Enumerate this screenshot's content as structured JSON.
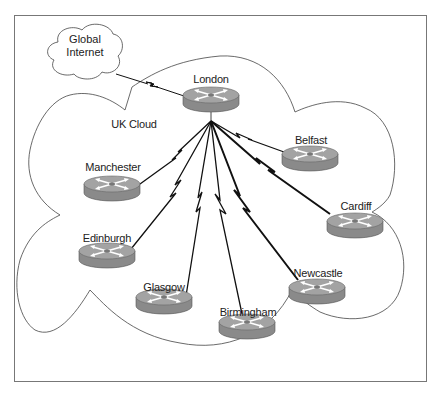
{
  "diagram": {
    "global_cloud": {
      "line1": "Global",
      "line2": "Internet"
    },
    "uk_cloud_label": "UK Cloud",
    "hub": {
      "name": "London",
      "x": 211,
      "y": 99
    },
    "sites": [
      {
        "name": "Belfast",
        "x": 310,
        "y": 157
      },
      {
        "name": "Cardiff",
        "x": 355,
        "y": 224
      },
      {
        "name": "Manchester",
        "x": 112,
        "y": 187
      },
      {
        "name": "Edinburgh",
        "x": 107,
        "y": 254
      },
      {
        "name": "Glasgow",
        "x": 164,
        "y": 300
      },
      {
        "name": "Birmingham",
        "x": 247,
        "y": 325
      },
      {
        "name": "Newcastle",
        "x": 317,
        "y": 290
      }
    ],
    "colors": {
      "router_top": "#a3a3a3",
      "router_side": "#8a8a8a",
      "line": "#111111"
    }
  }
}
